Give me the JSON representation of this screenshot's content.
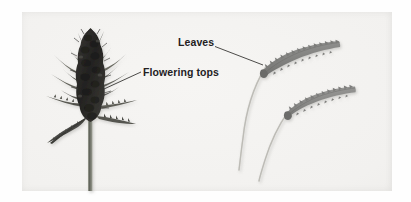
{
  "figure": {
    "background_color": "#fefefe",
    "panel_color": "#f2f1ef"
  },
  "labels": [
    {
      "id": "leaves",
      "text": "Leaves",
      "x": 178,
      "y": 36,
      "leader_from": [
        215,
        47
      ],
      "leader_to": [
        263,
        65
      ]
    },
    {
      "id": "flowering-tops",
      "text": "Flowering tops",
      "x": 143,
      "y": 66,
      "leader_from": [
        141,
        72
      ],
      "leader_to": [
        104,
        89
      ]
    }
  ],
  "specimens": [
    {
      "id": "flowering-top",
      "name": "Flowering tops specimen",
      "color": "#2d2c2a",
      "stem_color": "#7b7e73",
      "center_x": 90,
      "top_y": 28,
      "bottom_y": 190
    },
    {
      "id": "leaf-upper",
      "name": "Upper serrated leaf",
      "color": "#8b8b89",
      "petiole_color": "#c9c8c2"
    },
    {
      "id": "leaf-lower",
      "name": "Lower serrated leaf",
      "color": "#8b8b89",
      "petiole_color": "#c9c8c2"
    }
  ],
  "colors": {
    "label_text": "#23211f",
    "leader_line": "#3a3a3a",
    "bud_dark": "#2d2c2a",
    "leaf_gray": "#8b8b89",
    "stem_green_gray": "#7b7e73",
    "petiole_light": "#c9c8c2"
  }
}
